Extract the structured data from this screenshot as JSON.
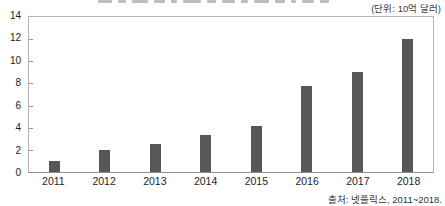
{
  "header": {
    "unit_label": "(단위: 10억 달러)"
  },
  "footer": {
    "source": "출처: 넷플릭스, 2011~2018."
  },
  "chart_data": {
    "type": "bar",
    "categories": [
      "2011",
      "2012",
      "2013",
      "2014",
      "2015",
      "2016",
      "2017",
      "2018"
    ],
    "values": [
      1,
      2,
      2.5,
      3.3,
      4.2,
      7.8,
      9,
      12
    ],
    "title": "",
    "xlabel": "",
    "ylabel": "",
    "ylim": [
      0,
      14
    ],
    "yticks": [
      0,
      2,
      4,
      6,
      8,
      10,
      12,
      14
    ],
    "grid": false,
    "legend": false,
    "bar_color": "#575757",
    "border_color": "#b3b3b3",
    "text_color": "#222222"
  }
}
